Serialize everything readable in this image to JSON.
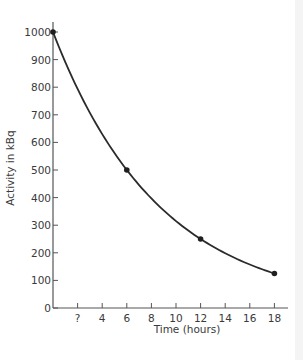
{
  "chart_data": {
    "type": "line",
    "title": "",
    "xlabel": "Time (hours)",
    "ylabel": "Activity in kBq",
    "x": [
      0,
      6,
      12,
      18
    ],
    "series": [
      {
        "name": "Activity",
        "values": [
          1000,
          500,
          250,
          125
        ],
        "markers": true,
        "smooth": true
      }
    ],
    "xlim": [
      0,
      19
    ],
    "ylim": [
      0,
      1000
    ],
    "xticks": [
      2,
      4,
      6,
      8,
      10,
      12,
      14,
      16,
      18
    ],
    "xtick_labels": [
      "?",
      "4",
      "6",
      "8",
      "10",
      "12",
      "14",
      "16",
      "18"
    ],
    "yticks": [
      0,
      100,
      200,
      300,
      400,
      500,
      600,
      700,
      800,
      900,
      1000
    ],
    "ytick_labels": [
      "0",
      "100",
      "200",
      "300",
      "400",
      "500",
      "600",
      "700",
      "800",
      "900",
      "1000"
    ],
    "grid": false,
    "legend": null,
    "colors": {
      "line": "#2b2b2b",
      "axis": "#555555",
      "text": "#3a3a3a"
    }
  }
}
